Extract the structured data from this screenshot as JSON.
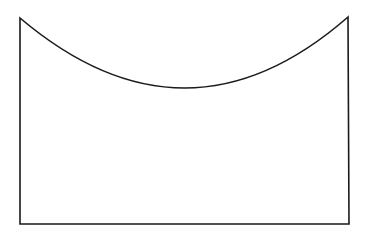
{
  "diagram": {
    "background": "#ffffff",
    "stroke_color": "#1a1a1a",
    "stroke_width": 1.6,
    "shape": {
      "top_left": [
        20,
        18
      ],
      "top_right": [
        348,
        17
      ],
      "bottom_left": [
        20,
        224
      ],
      "bottom_right": [
        349,
        224
      ],
      "arc_lowest_point": [
        185,
        88
      ]
    }
  }
}
